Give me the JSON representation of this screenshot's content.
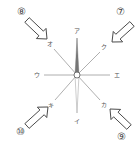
{
  "diagram": {
    "type": "compass-direction-diagram",
    "center": {
      "x": 77,
      "y": 75
    },
    "directions": [
      {
        "id": "n",
        "label": "ア",
        "x": 77,
        "y": 31,
        "line_end": {
          "x": 77,
          "y": 38
        }
      },
      {
        "id": "s",
        "label": "イ",
        "x": 77,
        "y": 121,
        "line_end": {
          "x": 77,
          "y": 113
        }
      },
      {
        "id": "w",
        "label": "ウ",
        "x": 37,
        "y": 75,
        "line_end": {
          "x": 44,
          "y": 75
        }
      },
      {
        "id": "e",
        "label": "エ",
        "x": 117,
        "y": 75,
        "line_end": {
          "x": 110,
          "y": 75
        }
      },
      {
        "id": "nw",
        "label": "オ",
        "x": 50,
        "y": 44,
        "line_end": {
          "x": 54,
          "y": 49
        }
      },
      {
        "id": "ne",
        "label": "ク",
        "x": 104,
        "y": 47,
        "line_end": {
          "x": 100,
          "y": 52
        }
      },
      {
        "id": "sw",
        "label": "キ",
        "x": 51,
        "y": 105,
        "line_end": {
          "x": 55,
          "y": 100
        }
      },
      {
        "id": "se",
        "label": "カ",
        "x": 104,
        "y": 105,
        "line_end": {
          "x": 100,
          "y": 100
        }
      }
    ],
    "arrows": [
      {
        "id": "arrow-8",
        "number": "⑧",
        "num_x": 21,
        "num_y": 12,
        "from": {
          "x": 27,
          "y": 20
        },
        "to": {
          "x": 47,
          "y": 39
        },
        "direction": "southeast"
      },
      {
        "id": "arrow-7",
        "number": "⑦",
        "num_x": 120,
        "num_y": 12,
        "from": {
          "x": 132,
          "y": 24
        },
        "to": {
          "x": 112,
          "y": 42
        },
        "direction": "southwest"
      },
      {
        "id": "arrow-10",
        "number": "⑩",
        "num_x": 20,
        "num_y": 132,
        "from": {
          "x": 27,
          "y": 126
        },
        "to": {
          "x": 48,
          "y": 107
        },
        "direction": "northeast"
      },
      {
        "id": "arrow-9",
        "number": "⑨",
        "num_x": 121,
        "num_y": 137,
        "from": {
          "x": 129,
          "y": 127
        },
        "to": {
          "x": 110,
          "y": 109
        },
        "direction": "northwest"
      }
    ],
    "colors": {
      "line": "#9a9a9a",
      "needle_north": "#666666",
      "needle_south": "#cccccc",
      "arrow_stroke": "#444444",
      "text": "#555555"
    }
  }
}
